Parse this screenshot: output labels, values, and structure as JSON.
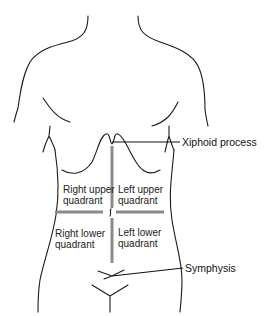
{
  "diagram": {
    "quadrants": [
      {
        "id": "ruq",
        "line1": "Right upper",
        "line2": "quadrant"
      },
      {
        "id": "luq",
        "line1": "Left upper",
        "line2": "quadrant"
      },
      {
        "id": "rlq",
        "line1": "Right lower",
        "line2": "quadrant"
      },
      {
        "id": "llq",
        "line1": "Left lower",
        "line2": "quadrant"
      }
    ],
    "callouts": {
      "xiphoid": "Xiphoid process",
      "symphysis": "Symphysis"
    },
    "colors": {
      "outline": "#1a1a1a",
      "divider": "#8a8a8a",
      "background": "#ffffff"
    }
  }
}
